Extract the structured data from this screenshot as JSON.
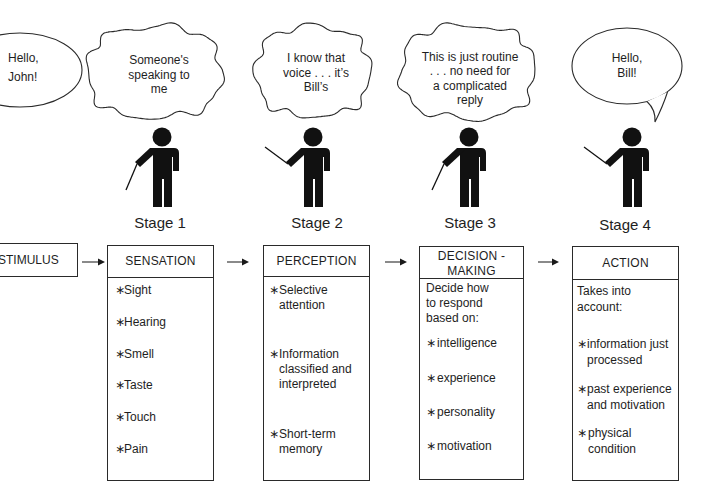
{
  "colors": {
    "ink": "#1e1e1e",
    "line": "#2a2a2a",
    "figure": "#111111",
    "background": "#ffffff"
  },
  "bullet": "∗",
  "speech": {
    "john": {
      "lines": [
        "Hello,",
        "John!"
      ]
    },
    "bill": {
      "lines": [
        "Hello,",
        "Bill!"
      ]
    }
  },
  "thoughts": [
    {
      "lines": [
        "Someone's",
        "speaking to",
        "me"
      ]
    },
    {
      "lines": [
        "I know that",
        "voice . . . it’s",
        "Bill’s"
      ]
    },
    {
      "lines": [
        "This is just routine",
        ". . . no need for",
        "a complicated",
        "reply"
      ]
    }
  ],
  "stages": [
    "Stage 1",
    "Stage 2",
    "Stage 3",
    "Stage 4"
  ],
  "stimulus": {
    "label": "STIMULUS"
  },
  "boxes": {
    "sensation": {
      "title": [
        "SENSATION"
      ],
      "items": [
        {
          "lines": [
            "Sight"
          ]
        },
        {
          "lines": [
            "Hearing"
          ]
        },
        {
          "lines": [
            "Smell"
          ]
        },
        {
          "lines": [
            "Taste"
          ]
        },
        {
          "lines": [
            "Touch"
          ]
        },
        {
          "lines": [
            "Pain"
          ]
        }
      ]
    },
    "perception": {
      "title": [
        "PERCEPTION"
      ],
      "items": [
        {
          "lines": [
            "Selective",
            "attention"
          ]
        },
        {
          "lines": [
            "Information",
            "classified and",
            "interpreted"
          ]
        },
        {
          "lines": [
            "Short-term",
            "memory"
          ]
        }
      ]
    },
    "decision": {
      "title": [
        "DECISION -",
        "MAKING"
      ],
      "intro": [
        "Decide how",
        "to respond",
        "based on:"
      ],
      "items": [
        {
          "lines": [
            "intelligence"
          ]
        },
        {
          "lines": [
            "experience"
          ]
        },
        {
          "lines": [
            "personality"
          ]
        },
        {
          "lines": [
            "motivation"
          ]
        }
      ]
    },
    "action": {
      "title": [
        "ACTION"
      ],
      "intro": [
        "Takes into",
        "account:"
      ],
      "items": [
        {
          "lines": [
            "information just",
            "processed"
          ]
        },
        {
          "lines": [
            "past experience",
            "and motivation"
          ]
        },
        {
          "lines": [
            "physical",
            "condition"
          ]
        }
      ]
    }
  }
}
